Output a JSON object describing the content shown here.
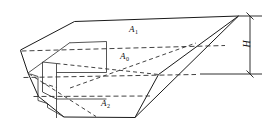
{
  "figure": {
    "kind": "engineering-line-drawing",
    "background_color": "#ffffff",
    "line_color": "#1a1a1a",
    "hidden_line_color": "#2e2e2e"
  },
  "labels": {
    "top_section": {
      "symbol": "A",
      "subscript": "1",
      "full": "A1"
    },
    "middle_section": {
      "symbol": "A",
      "subscript": "0",
      "full": "A0"
    },
    "bottom_section": {
      "symbol": "A",
      "subscript": "2",
      "full": "A2"
    },
    "height_dimension": {
      "symbol": "H",
      "full": "H"
    }
  },
  "dimension": {
    "name": "overall-height",
    "symbol": "H",
    "orientation": "vertical",
    "side": "right"
  }
}
